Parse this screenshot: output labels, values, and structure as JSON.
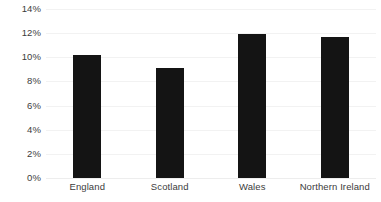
{
  "chart_data": {
    "type": "bar",
    "title": "",
    "subtitle": "",
    "xlabel": "",
    "ylabel": "",
    "categories": [
      "England",
      "Scotland",
      "Wales",
      "Northern Ireland"
    ],
    "values": [
      10.2,
      9.1,
      11.9,
      11.7
    ],
    "value_format": "percent",
    "ylim": [
      0,
      14
    ],
    "ytick_step": 2,
    "ytick_labels": [
      "14%",
      "12%",
      "10%",
      "8%",
      "6%",
      "4%",
      "2%",
      "0%"
    ],
    "ytick_values": [
      14,
      12,
      10,
      8,
      6,
      4,
      2,
      0
    ],
    "grid": true,
    "grid_axis": "y",
    "legend": false,
    "legend_position": "none",
    "series": [
      {
        "name": "",
        "values": [
          10.2,
          9.1,
          11.9,
          11.7
        ]
      }
    ],
    "colors": {
      "bar": "#141414",
      "gridline": "#f2f2f2",
      "tick_label": "#3c3c3c",
      "background": "#ffffff"
    }
  }
}
